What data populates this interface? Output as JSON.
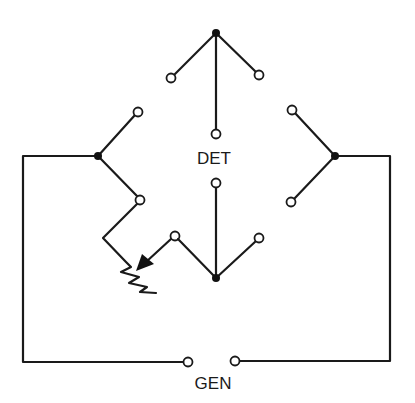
{
  "diagram": {
    "type": "circuit-schematic",
    "labels": {
      "detector": "DET",
      "generator": "GEN"
    },
    "components": [
      {
        "id": "detector",
        "label": "DET"
      },
      {
        "id": "generator",
        "label": "GEN"
      },
      {
        "id": "variable-resistor",
        "label": ""
      }
    ],
    "junctions": [
      {
        "id": "top",
        "x": 216,
        "y": 33
      },
      {
        "id": "left",
        "x": 98,
        "y": 156
      },
      {
        "id": "right",
        "x": 335,
        "y": 156
      },
      {
        "id": "bottom",
        "x": 216,
        "y": 278
      }
    ],
    "terminal_count": 14,
    "colors": {
      "line": "#1a1a1a",
      "background": "#ffffff"
    }
  }
}
